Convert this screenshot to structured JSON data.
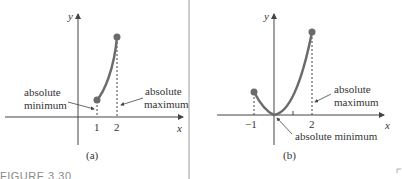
{
  "figure": {
    "caption": "FIGURE 3.30",
    "panels": [
      {
        "id": "a",
        "label": "(a)",
        "axis_labels": {
          "x": "x",
          "y": "y"
        },
        "ticks": [
          "1",
          "2"
        ],
        "annotations": {
          "min_line1": "absolute",
          "min_line2": "minimum",
          "max_line1": "absolute",
          "max_line2": "maximum"
        }
      },
      {
        "id": "b",
        "label": "(b)",
        "axis_labels": {
          "x": "x",
          "y": "y"
        },
        "ticks": [
          "−1",
          "2"
        ],
        "annotations": {
          "max_line1": "absolute",
          "max_line2": "maximum",
          "min": "absolute minimum"
        }
      }
    ]
  },
  "colors": {
    "curve": "#6b6b6b",
    "axis": "#444444",
    "divider": "#bdbdbd"
  }
}
